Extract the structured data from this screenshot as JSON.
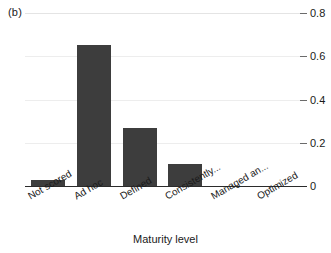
{
  "figure": {
    "panel_label": "(b)",
    "xlabel": "Maturity level"
  },
  "chart_data": {
    "type": "bar",
    "title": "",
    "subtitle": "",
    "panel": "(b)",
    "categories": [
      "Not scored",
      "Ad hoc",
      "Defined",
      "Consistently...",
      "Managed an...",
      "Optimized"
    ],
    "values": [
      0.03,
      0.65,
      0.27,
      0.1,
      0.0,
      0.0
    ],
    "xlabel": "Maturity level",
    "ylabel": "",
    "ylim": [
      0,
      0.8
    ],
    "yticks": [
      0,
      0.2,
      0.4,
      0.6,
      0.8
    ],
    "ytick_labels": [
      "0",
      "0.2",
      "0.4",
      "0.6",
      "0.8"
    ],
    "y_axis_position": "right",
    "grid": true,
    "grid_axis": "y",
    "legend": false,
    "bar_color": "#3d3d3d",
    "grid_color": "#ededed",
    "axis_color": "#2b2b2b"
  }
}
